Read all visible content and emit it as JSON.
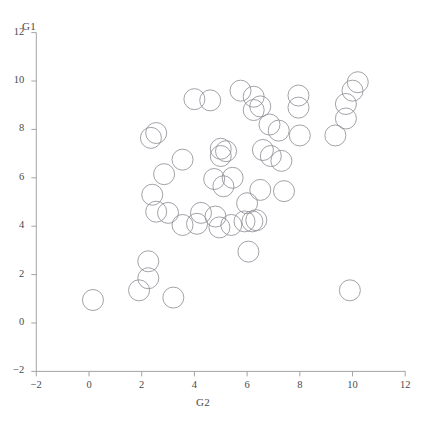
{
  "chart_data": {
    "type": "scatter",
    "title": "",
    "xlabel": "G2",
    "ylabel": "G1",
    "xlim": [
      -2,
      12
    ],
    "ylim": [
      -2,
      12
    ],
    "xticks": [
      -2,
      0,
      2,
      4,
      6,
      8,
      10,
      12
    ],
    "yticks": [
      -2,
      0,
      2,
      4,
      6,
      8,
      10,
      12
    ],
    "grid": false,
    "legend": null,
    "marker": {
      "shape": "circle-open",
      "edge_color": "#8a8a93",
      "fill": "none",
      "size_px": 21,
      "edge_width": 0.8
    },
    "axis_color": "#9a9a9a",
    "points": [
      {
        "x": 0.15,
        "y": 0.95
      },
      {
        "x": 1.9,
        "y": 1.35
      },
      {
        "x": 3.2,
        "y": 1.05
      },
      {
        "x": 2.25,
        "y": 2.55
      },
      {
        "x": 2.25,
        "y": 1.85
      },
      {
        "x": 2.55,
        "y": 4.6
      },
      {
        "x": 2.4,
        "y": 5.3
      },
      {
        "x": 2.85,
        "y": 6.15
      },
      {
        "x": 3.55,
        "y": 4.05
      },
      {
        "x": 4.1,
        "y": 4.1
      },
      {
        "x": 3.0,
        "y": 4.55
      },
      {
        "x": 3.55,
        "y": 6.75
      },
      {
        "x": 2.55,
        "y": 7.85
      },
      {
        "x": 2.35,
        "y": 7.65
      },
      {
        "x": 4.0,
        "y": 9.25
      },
      {
        "x": 4.6,
        "y": 9.2
      },
      {
        "x": 4.25,
        "y": 4.55
      },
      {
        "x": 4.8,
        "y": 4.4
      },
      {
        "x": 4.95,
        "y": 3.95
      },
      {
        "x": 5.4,
        "y": 4.05
      },
      {
        "x": 5.0,
        "y": 7.2
      },
      {
        "x": 5.2,
        "y": 7.1
      },
      {
        "x": 5.0,
        "y": 6.9
      },
      {
        "x": 4.75,
        "y": 5.95
      },
      {
        "x": 5.45,
        "y": 6.0
      },
      {
        "x": 5.1,
        "y": 5.65
      },
      {
        "x": 6.05,
        "y": 2.95
      },
      {
        "x": 5.9,
        "y": 4.2
      },
      {
        "x": 6.2,
        "y": 4.2
      },
      {
        "x": 6.35,
        "y": 4.25
      },
      {
        "x": 6.0,
        "y": 4.95
      },
      {
        "x": 6.6,
        "y": 7.15
      },
      {
        "x": 6.9,
        "y": 6.9
      },
      {
        "x": 7.3,
        "y": 6.7
      },
      {
        "x": 7.4,
        "y": 5.45
      },
      {
        "x": 6.5,
        "y": 5.5
      },
      {
        "x": 5.75,
        "y": 9.6
      },
      {
        "x": 6.25,
        "y": 9.35
      },
      {
        "x": 6.5,
        "y": 8.95
      },
      {
        "x": 6.25,
        "y": 8.8
      },
      {
        "x": 6.85,
        "y": 8.2
      },
      {
        "x": 7.95,
        "y": 8.9
      },
      {
        "x": 7.2,
        "y": 7.95
      },
      {
        "x": 8.0,
        "y": 7.75
      },
      {
        "x": 7.95,
        "y": 9.4
      },
      {
        "x": 9.35,
        "y": 7.75
      },
      {
        "x": 9.75,
        "y": 8.45
      },
      {
        "x": 10.0,
        "y": 9.6
      },
      {
        "x": 10.2,
        "y": 9.95
      },
      {
        "x": 9.75,
        "y": 9.05
      },
      {
        "x": 9.9,
        "y": 1.35
      }
    ]
  }
}
